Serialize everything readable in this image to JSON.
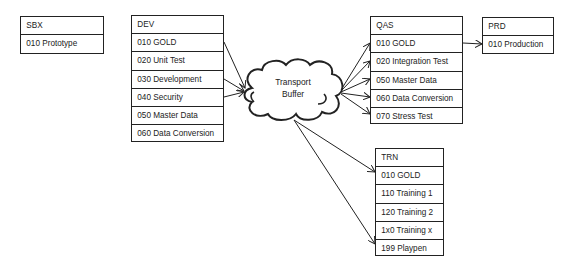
{
  "diagram": {
    "systems": [
      {
        "id": "SBX",
        "label": "SBX",
        "clients": [
          "010 Prototype"
        ]
      },
      {
        "id": "DEV",
        "label": "DEV",
        "clients": [
          "010 GOLD",
          "020 Unit Test",
          "030 Development",
          "040 Security",
          "050 Master Data",
          "060 Data Conversion"
        ]
      },
      {
        "id": "QAS",
        "label": "QAS",
        "clients": [
          "010 GOLD",
          "020 Integration Test",
          "050 Master Data",
          "060 Data Conversion",
          "070 Stress Test"
        ]
      },
      {
        "id": "PRD",
        "label": "PRD",
        "clients": [
          "010 Production"
        ]
      },
      {
        "id": "TRN",
        "label": "TRN",
        "clients": [
          "010 GOLD",
          "110 Training 1",
          "120 Training 2",
          "1x0 Training x",
          "199 Playpen"
        ]
      }
    ],
    "buffer": {
      "line1": "Transport",
      "line2": "Buffer"
    },
    "edges": [
      {
        "from": "DEV 010 GOLD",
        "to": "Transport Buffer"
      },
      {
        "from": "DEV 030 Development",
        "to": "Transport Buffer"
      },
      {
        "from": "DEV 040 Security",
        "to": "Transport Buffer"
      },
      {
        "from": "Transport Buffer",
        "to": "QAS 010 GOLD"
      },
      {
        "from": "Transport Buffer",
        "to": "QAS 020 Integration Test"
      },
      {
        "from": "Transport Buffer",
        "to": "QAS 050 Master Data"
      },
      {
        "from": "Transport Buffer",
        "to": "QAS 060 Data Conversion"
      },
      {
        "from": "Transport Buffer",
        "to": "QAS 070 Stress Test"
      },
      {
        "from": "QAS 010 GOLD",
        "to": "PRD 010 Production"
      },
      {
        "from": "Transport Buffer",
        "to": "TRN 010 GOLD"
      },
      {
        "from": "Transport Buffer",
        "to": "TRN 199 Playpen"
      }
    ]
  }
}
